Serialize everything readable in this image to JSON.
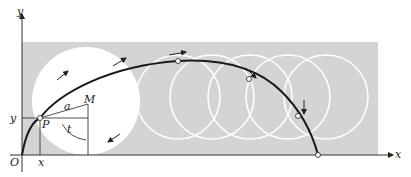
{
  "diagram": {
    "type": "cycloid-construction",
    "labels": {
      "y_axis": "y",
      "x_axis": "x",
      "origin": "O",
      "point_p": "P",
      "center_m": "M",
      "radius": "a",
      "angle": "t",
      "x_coord": "x",
      "y_coord": "y"
    },
    "colors": {
      "background_band": "#d6d6d6",
      "circle_fill": "#ffffff",
      "circle_outline": "#ffffff",
      "curve": "#1a1a1a",
      "axes": "#333333"
    },
    "rolling_circles": 5,
    "marked_points_on_curve": 4
  }
}
